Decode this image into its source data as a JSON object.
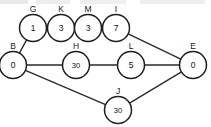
{
  "diagram": {
    "type": "node-link-graph",
    "title": "",
    "background_color": "#ffffff",
    "node_fill_color": "#ffffff",
    "node_stroke_color": "#1e1e1e",
    "edge_color": "#2b2b2b",
    "text_color": "#111111",
    "nodes": [
      {
        "id": "G",
        "label": "G",
        "value": "1",
        "cx": 33,
        "cy": 28,
        "r": 13.5,
        "label_x": 33,
        "label_y": 12
      },
      {
        "id": "K",
        "label": "K",
        "value": "3",
        "cx": 61,
        "cy": 28,
        "r": 13.5,
        "label_x": 61,
        "label_y": 12
      },
      {
        "id": "M",
        "label": "M",
        "value": "3",
        "cx": 88,
        "cy": 28,
        "r": 13.5,
        "label_x": 88,
        "label_y": 12
      },
      {
        "id": "I",
        "label": "I",
        "value": "7",
        "cx": 116,
        "cy": 28,
        "r": 13.5,
        "label_x": 116,
        "label_y": 12
      },
      {
        "id": "B",
        "label": "B",
        "value": "0",
        "cx": 13,
        "cy": 65,
        "r": 13.5,
        "label_x": 13,
        "label_y": 49
      },
      {
        "id": "H",
        "label": "H",
        "value": "30",
        "cx": 76,
        "cy": 65,
        "r": 13.5,
        "label_x": 76,
        "label_y": 49
      },
      {
        "id": "L",
        "label": "L",
        "value": "5",
        "cx": 131,
        "cy": 65,
        "r": 13.5,
        "label_x": 131,
        "label_y": 49
      },
      {
        "id": "E",
        "label": "E",
        "value": "0",
        "cx": 193,
        "cy": 65,
        "r": 13.5,
        "label_x": 193,
        "label_y": 49
      },
      {
        "id": "J",
        "label": "J",
        "value": "30",
        "cx": 118,
        "cy": 110,
        "r": 13.5,
        "label_x": 118,
        "label_y": 94
      }
    ],
    "edges": [
      {
        "from": "B",
        "to": "G"
      },
      {
        "from": "G",
        "to": "K"
      },
      {
        "from": "K",
        "to": "M"
      },
      {
        "from": "M",
        "to": "I"
      },
      {
        "from": "I",
        "to": "E"
      },
      {
        "from": "B",
        "to": "H"
      },
      {
        "from": "H",
        "to": "L"
      },
      {
        "from": "L",
        "to": "E"
      },
      {
        "from": "B",
        "to": "J"
      },
      {
        "from": "J",
        "to": "E"
      }
    ]
  }
}
